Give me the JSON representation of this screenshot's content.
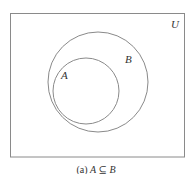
{
  "diagram": {
    "type": "venn",
    "universe_label": "U",
    "sets": [
      {
        "name": "B",
        "label": "B",
        "cx": 98,
        "cy": 82,
        "r": 50
      },
      {
        "name": "A",
        "label": "A",
        "cx": 86,
        "cy": 91,
        "r": 33
      }
    ],
    "relation": "A ⊆ B",
    "caption": {
      "prefix": "(a)",
      "left": "A",
      "symbol": "⊆",
      "right": "B"
    }
  },
  "colors": {
    "stroke": "#8a8a8a",
    "text": "#333333"
  }
}
